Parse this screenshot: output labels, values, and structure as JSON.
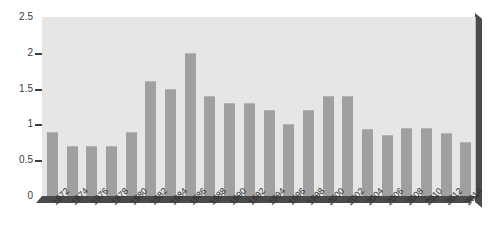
{
  "chart_data": {
    "type": "bar",
    "title": "",
    "subtitle": "",
    "xlabel": "",
    "ylabel": "",
    "categories": [
      "1972",
      "1974",
      "1976",
      "1978",
      "1980",
      "1982",
      "1984",
      "1986",
      "1988",
      "1990",
      "1992",
      "1994",
      "1996",
      "1998",
      "2000",
      "2002",
      "2004",
      "2006",
      "2008",
      "2010",
      "2012",
      "2014"
    ],
    "values": [
      0.9,
      0.7,
      0.7,
      0.7,
      0.9,
      1.6,
      1.5,
      2.0,
      1.4,
      1.3,
      1.3,
      1.2,
      1.0,
      1.2,
      1.4,
      1.4,
      0.93,
      0.85,
      0.95,
      0.95,
      0.88,
      0.75
    ],
    "ylim": [
      0,
      2.5
    ],
    "yticks": [
      0,
      0.5,
      1,
      1.5,
      2,
      2.5
    ],
    "ytick_labels": [
      "0",
      "0.5",
      "1",
      "1.5",
      "2",
      "2.5"
    ],
    "grid": false,
    "legend": null,
    "legend_position": "none",
    "annotations": [],
    "series": [
      {
        "name": "",
        "values": [
          0.9,
          0.7,
          0.7,
          0.7,
          0.9,
          1.6,
          1.5,
          2.0,
          1.4,
          1.3,
          1.3,
          1.2,
          1.0,
          1.2,
          1.4,
          1.4,
          0.93,
          0.85,
          0.95,
          0.95,
          0.88,
          0.75
        ]
      }
    ]
  },
  "style": {
    "bar_color": "#a0a0a0",
    "panel_color": "#e6e6e6",
    "shadow_color": "#4a4a4a",
    "text_color": "#2e2e2e"
  }
}
